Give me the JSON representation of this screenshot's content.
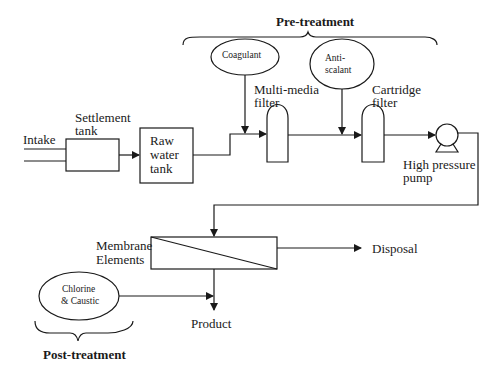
{
  "diagram": {
    "groups": {
      "pre_treatment": "Pre-treatment",
      "post_treatment": "Post-treatment"
    },
    "nodes": {
      "intake": "Intake",
      "settlement_tank_line1": "Settlement",
      "settlement_tank_line2": "tank",
      "raw_water_tank_line1": "Raw",
      "raw_water_tank_line2": "water",
      "raw_water_tank_line3": "tank",
      "coagulant": "Coagulant",
      "multimedia_filter_line1": "Multi-media",
      "multimedia_filter_line2": "filter",
      "antiscalant_line1": "Anti-",
      "antiscalant_line2": "scalant",
      "cartridge_filter_line1": "Cartridge",
      "cartridge_filter_line2": "filter",
      "pump_line1": "High pressure",
      "pump_line2": "pump",
      "membrane_line1": "Membrane",
      "membrane_line2": "Elements",
      "disposal": "Disposal",
      "chlorine_line1": "Chlorine",
      "chlorine_line2": "& Caustic",
      "product": "Product"
    },
    "edges": [
      [
        "Intake",
        "Settlement tank"
      ],
      [
        "Settlement tank",
        "Raw water tank"
      ],
      [
        "Raw water tank",
        "Multi-media filter"
      ],
      [
        "Coagulant",
        "Multi-media filter"
      ],
      [
        "Multi-media filter",
        "Cartridge filter"
      ],
      [
        "Anti-scalant",
        "Cartridge filter"
      ],
      [
        "Cartridge filter",
        "High pressure pump"
      ],
      [
        "High pressure pump",
        "Membrane Elements"
      ],
      [
        "Membrane Elements",
        "Disposal"
      ],
      [
        "Membrane Elements",
        "Product"
      ],
      [
        "Chlorine & Caustic",
        "Product"
      ]
    ]
  }
}
